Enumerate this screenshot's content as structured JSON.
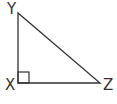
{
  "diagram": {
    "type": "right-triangle",
    "stroke_color": "#333333",
    "vertices": [
      {
        "label": "Y",
        "x": 18,
        "y": 13
      },
      {
        "label": "X",
        "x": 18,
        "y": 83
      },
      {
        "label": "Z",
        "x": 100,
        "y": 83
      }
    ],
    "right_angle_at": "X"
  }
}
